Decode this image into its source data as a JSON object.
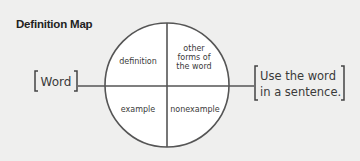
{
  "title": "Definition Map",
  "diagram": {
    "center_label": "Word",
    "right_label_lines": [
      "Use the word",
      "in a sentence."
    ],
    "quadrants": {
      "top_left": [
        "definition"
      ],
      "top_right": [
        "other",
        "forms of",
        "the word"
      ],
      "bottom_left": [
        "example"
      ],
      "bottom_right": [
        "nonexample"
      ]
    },
    "colors": {
      "background": "#efefee",
      "circle_fill": "#ffffff",
      "stroke": "#555555",
      "text": "#3a3a3a"
    }
  }
}
